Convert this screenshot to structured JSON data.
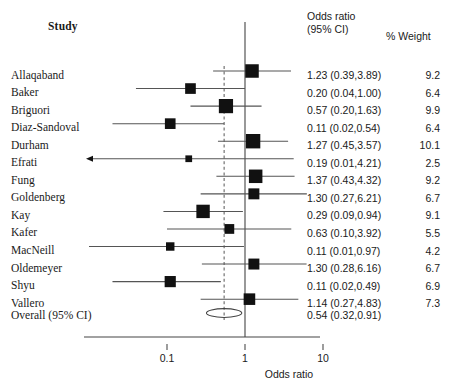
{
  "header": {
    "study_label": "Study",
    "or_line1": "Odds ratio",
    "or_line2": "(95% CI)",
    "weight_label": "% Weight"
  },
  "axis": {
    "title": "Odds ratio",
    "ticks": [
      "0.1",
      "1",
      "10"
    ],
    "tick_values": [
      0.1,
      1,
      10
    ],
    "scale": "log10",
    "null_value": 1
  },
  "overall": {
    "label": "Overall (95% CI)",
    "or_text": "0.54 (0.32,0.91)",
    "estimate": 0.54,
    "lower": 0.32,
    "upper": 0.91
  },
  "colors": {
    "marker": "#111111",
    "line": "#555555",
    "axis": "#444444",
    "dashed": "#666666",
    "text": "#1a1a1a"
  },
  "chart_data": {
    "type": "forest",
    "title": "",
    "xlabel": "Odds ratio",
    "ylabel": "",
    "xscale": "log10",
    "xlim": [
      0.07,
      13
    ],
    "xticks": [
      0.1,
      1,
      10
    ],
    "xticklabels": [
      "0.1",
      "1",
      "10"
    ],
    "reference_line": 1,
    "pooled_line": 0.54,
    "effect_measure": "Odds ratio",
    "ci_level": "95% CI",
    "columns": [
      "Study",
      "Odds ratio (95% CI)",
      "% Weight"
    ],
    "rows": [
      {
        "study": "Allaqaband",
        "or": 1.23,
        "lower": 0.39,
        "upper": 3.89,
        "weight": 9.2,
        "or_text": "1.23 (0.39,3.89)",
        "weight_text": "9.2",
        "clipped_left": false
      },
      {
        "study": "Baker",
        "or": 0.2,
        "lower": 0.04,
        "upper": 1.0,
        "weight": 6.4,
        "or_text": "0.20 (0.04,1.00)",
        "weight_text": "6.4",
        "clipped_left": false
      },
      {
        "study": "Briguori",
        "or": 0.57,
        "lower": 0.2,
        "upper": 1.63,
        "weight": 9.9,
        "or_text": "0.57 (0.20,1.63)",
        "weight_text": "9.9",
        "clipped_left": false
      },
      {
        "study": "Diaz-Sandoval",
        "or": 0.11,
        "lower": 0.02,
        "upper": 0.54,
        "weight": 6.4,
        "or_text": "0.11 (0.02,0.54)",
        "weight_text": "6.4",
        "clipped_left": false
      },
      {
        "study": "Durham",
        "or": 1.27,
        "lower": 0.45,
        "upper": 3.57,
        "weight": 10.1,
        "or_text": "1.27 (0.45,3.57)",
        "weight_text": "10.1",
        "clipped_left": false
      },
      {
        "study": "Efrati",
        "or": 0.19,
        "lower": 0.01,
        "upper": 4.21,
        "weight": 2.5,
        "or_text": "0.19 (0.01,4.21)",
        "weight_text": "2.5",
        "clipped_left": true
      },
      {
        "study": "Fung",
        "or": 1.37,
        "lower": 0.43,
        "upper": 4.32,
        "weight": 9.2,
        "or_text": "1.37 (0.43,4.32)",
        "weight_text": "9.2",
        "clipped_left": false
      },
      {
        "study": "Goldenberg",
        "or": 1.3,
        "lower": 0.27,
        "upper": 6.21,
        "weight": 6.7,
        "or_text": "1.30 (0.27,6.21)",
        "weight_text": "6.7",
        "clipped_left": false
      },
      {
        "study": "Kay",
        "or": 0.29,
        "lower": 0.09,
        "upper": 0.94,
        "weight": 9.1,
        "or_text": "0.29 (0.09,0.94)",
        "weight_text": "9.1",
        "clipped_left": false
      },
      {
        "study": "Kafer",
        "or": 0.63,
        "lower": 0.1,
        "upper": 3.92,
        "weight": 5.5,
        "or_text": "0.63 (0.10,3.92)",
        "weight_text": "5.5",
        "clipped_left": false
      },
      {
        "study": "MacNeill",
        "or": 0.11,
        "lower": 0.01,
        "upper": 0.97,
        "weight": 4.2,
        "or_text": "0.11 (0.01,0.97)",
        "weight_text": "4.2",
        "clipped_left": false
      },
      {
        "study": "Oldemeyer",
        "or": 1.3,
        "lower": 0.28,
        "upper": 6.16,
        "weight": 6.7,
        "or_text": "1.30 (0.28,6.16)",
        "weight_text": "6.7",
        "clipped_left": false
      },
      {
        "study": "Shyu",
        "or": 0.11,
        "lower": 0.02,
        "upper": 0.49,
        "weight": 6.9,
        "or_text": "0.11 (0.02,0.49)",
        "weight_text": "6.9",
        "clipped_left": false
      },
      {
        "study": "Vallero",
        "or": 1.14,
        "lower": 0.27,
        "upper": 4.83,
        "weight": 7.3,
        "or_text": "1.14 (0.27,4.83)",
        "weight_text": "7.3",
        "clipped_left": false
      }
    ],
    "summary": {
      "label": "Overall (95% CI)",
      "or": 0.54,
      "lower": 0.32,
      "upper": 0.91,
      "or_text": "0.54 (0.32,0.91)"
    }
  }
}
